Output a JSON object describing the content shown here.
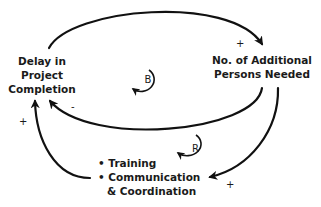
{
  "diagram": {
    "type": "causal-loop",
    "nodes": {
      "delay": {
        "lines": [
          "Delay in",
          "Project",
          "Completion"
        ]
      },
      "persons": {
        "lines": [
          "No. of Additional",
          "Persons Needed"
        ]
      },
      "training": {
        "lines": [
          "• Training",
          "• Communication",
          "& Coordination"
        ]
      }
    },
    "links": [
      {
        "from": "Delay in Project Completion",
        "to": "No. of Additional Persons Needed",
        "polarity": "+"
      },
      {
        "from": "No. of Additional Persons Needed",
        "to": "Delay in Project Completion",
        "polarity": "-"
      },
      {
        "from": "No. of Additional Persons Needed",
        "to": "Training / Communication & Coordination",
        "polarity": "+"
      },
      {
        "from": "Training / Communication & Coordination",
        "to": "Delay in Project Completion",
        "polarity": "+"
      }
    ],
    "loops": [
      {
        "label": "B",
        "meaning": "balancing"
      },
      {
        "label": "R",
        "meaning": "reinforcing"
      }
    ],
    "colors": {
      "line": "#111111",
      "text": "#1a1a1a",
      "background": "#ffffff"
    }
  }
}
